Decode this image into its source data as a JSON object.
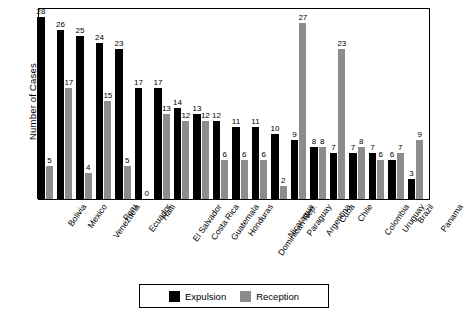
{
  "chart_data": {
    "type": "bar",
    "title": "",
    "xlabel": "",
    "ylabel": "Number of Cases",
    "ylim": [
      0,
      28
    ],
    "grid": false,
    "legend_position": "bottom-center",
    "categories": [
      "Bolivia",
      "Mexico",
      "Venezuela",
      "Peru",
      "Ecuador",
      "Haiti",
      "El Salvador",
      "Costa Rica",
      "Guatemala",
      "Honduras",
      "Dominican Rep.",
      "Nicaragua",
      "Paraguay",
      "Argentina",
      "Cuba",
      "Chile",
      "Colombia",
      "Uruguay",
      "Brazil",
      "Panama"
    ],
    "series": [
      {
        "name": "Expulsion",
        "color": "#000000",
        "values": [
          28,
          26,
          25,
          24,
          23,
          17,
          17,
          14,
          13,
          12,
          11,
          11,
          10,
          9,
          8,
          7,
          7,
          7,
          6,
          3
        ]
      },
      {
        "name": "Reception",
        "color": "#8C8C8C",
        "values": [
          5,
          17,
          4,
          15,
          5,
          0,
          13,
          12,
          12,
          6,
          6,
          6,
          2,
          27,
          8,
          23,
          8,
          6,
          7,
          9
        ]
      }
    ]
  },
  "legend": {
    "items": [
      {
        "label": "Expulsion",
        "color": "#000000"
      },
      {
        "label": "Reception",
        "color": "#8C8C8C"
      }
    ]
  },
  "axes": {
    "y_title": "Number of Cases"
  }
}
